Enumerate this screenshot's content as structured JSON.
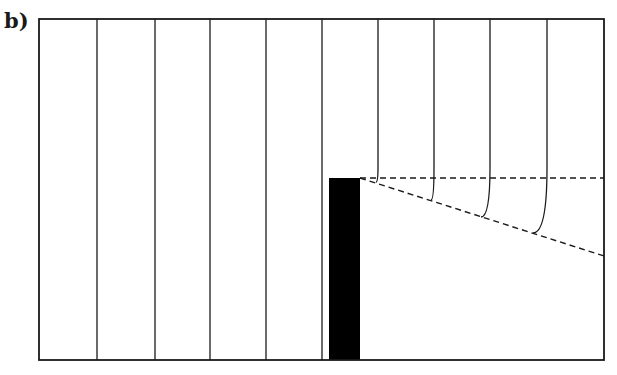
{
  "figure": {
    "panel_label": "b)",
    "cut_text_top": "",
    "frame": {
      "x1": 39,
      "y1": 19,
      "x2": 604,
      "y2": 360
    },
    "straight_lines_x": [
      97,
      155,
      210,
      266,
      322
    ],
    "curved_lines": [
      {
        "x": 378,
        "end_x": 376,
        "end_y": 182
      },
      {
        "x": 434,
        "end_x": 431,
        "end_y": 200
      },
      {
        "x": 490,
        "end_x": 481,
        "end_y": 217
      },
      {
        "x": 547,
        "end_x": 533,
        "end_y": 233
      }
    ],
    "block": {
      "x": 329,
      "y": 178,
      "w": 31,
      "h": 182,
      "color": "#000000"
    },
    "dashed_horizontal": {
      "x1": 360,
      "y1": 178,
      "x2": 604,
      "y2": 178
    },
    "dashed_slanted": {
      "x1": 360,
      "y1": 178,
      "x2": 604,
      "y2": 256
    },
    "line_color": "#1a1a1a"
  }
}
